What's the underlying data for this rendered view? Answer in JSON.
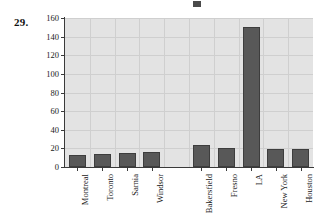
{
  "problem": {
    "number": "29."
  },
  "top_artifact": {
    "name": "cut-off-text-fragment"
  },
  "chart_data": {
    "type": "bar",
    "title": "",
    "subtitle": "",
    "xlabel": "",
    "ylabel": "",
    "categories": [
      "Montreal",
      "Toronto",
      "Sarnia",
      "Windsor",
      "",
      "Bakersfield",
      "Fresno",
      "LA",
      "New York",
      "Houston"
    ],
    "values": [
      13,
      14,
      15,
      16,
      null,
      24,
      20,
      150,
      19,
      19
    ],
    "ylim": [
      0,
      160
    ],
    "ytick_labels": [
      "0",
      "20",
      "40",
      "60",
      "80",
      "100",
      "120",
      "140",
      "160"
    ],
    "ytick_values": [
      0,
      20,
      40,
      60,
      80,
      100,
      120,
      140,
      160
    ],
    "grid": true,
    "legend": "none",
    "plot_background": "#e3e3e3",
    "bar_color": "#585858",
    "bar_edge_color": "#3d3d3d",
    "axis_color": "#3a3a3a",
    "gridline_color": "#cfcfcf"
  }
}
